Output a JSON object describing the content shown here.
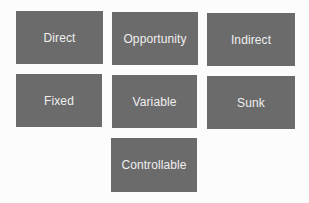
{
  "diagram": {
    "type": "grid of cost categories",
    "box_color": "#6b6b6b",
    "text_color": "#efefef",
    "background": "#fcfcfc",
    "boxes": [
      {
        "label": "Direct",
        "row": 1,
        "col": 1
      },
      {
        "label": "Opportunity",
        "row": 1,
        "col": 2
      },
      {
        "label": "Indirect",
        "row": 1,
        "col": 3
      },
      {
        "label": "Fixed",
        "row": 2,
        "col": 1
      },
      {
        "label": "Variable",
        "row": 2,
        "col": 2
      },
      {
        "label": "Sunk",
        "row": 2,
        "col": 3
      },
      {
        "label": "Controllable",
        "row": 3,
        "col": 2
      }
    ]
  }
}
